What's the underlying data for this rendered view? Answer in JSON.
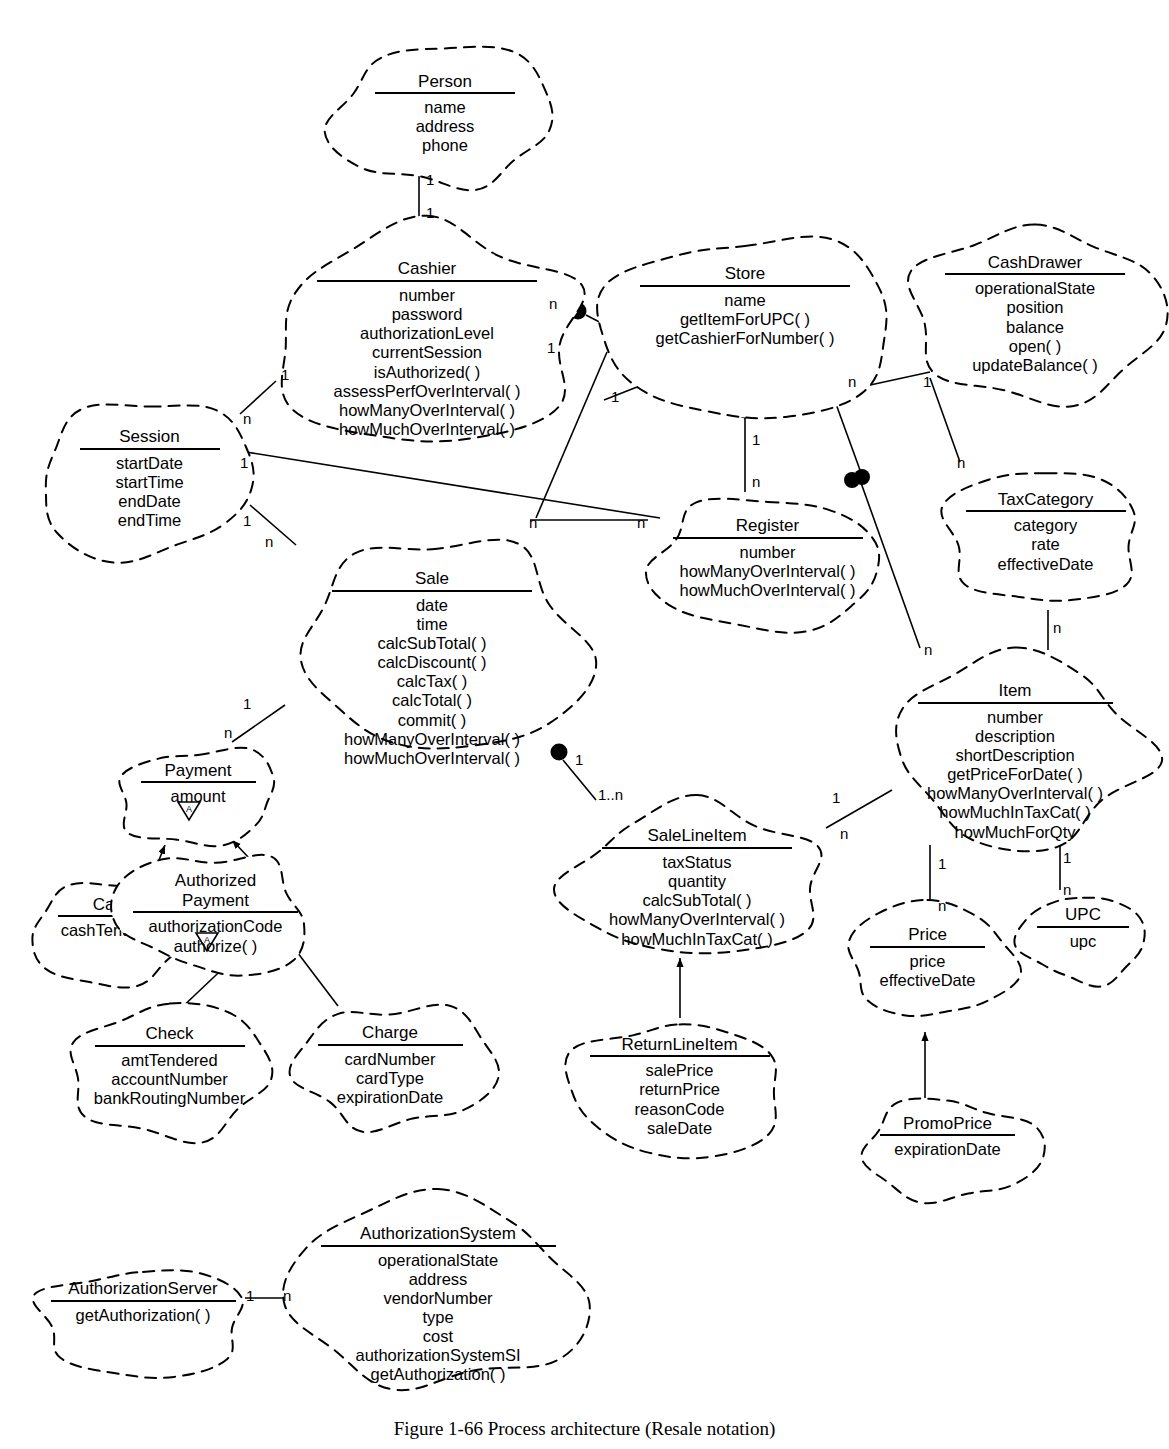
{
  "figure": {
    "caption": "Figure 1-66 Process architecture (Resale notation)"
  },
  "classes": [
    {
      "id": "person",
      "name": "Person",
      "members": [
        "name",
        "address",
        "phone"
      ],
      "x": 330,
      "y": 46,
      "w": 230,
      "h": 150,
      "nameW": 140
    },
    {
      "id": "cashier",
      "name": "Cashier",
      "members": [
        "number",
        "password",
        "authorizationLevel",
        "currentSession",
        "isAuthorized( )",
        "assessPerfOverInterval( )",
        "howManyOverInterval( )",
        "howMuchOverInterval( )"
      ],
      "x": 262,
      "y": 222,
      "w": 330,
      "h": 220,
      "nameW": 220
    },
    {
      "id": "store",
      "name": "Store",
      "members": [
        "name",
        "getItemForUPC( )",
        "getCashierForNumber( )"
      ],
      "x": 600,
      "y": 232,
      "w": 290,
      "h": 190,
      "nameW": 210
    },
    {
      "id": "cashdrawer",
      "name": "CashDrawer",
      "members": [
        "operationalState",
        "position",
        "balance",
        "open( )",
        "updateBalance( )"
      ],
      "x": 910,
      "y": 222,
      "w": 250,
      "h": 180,
      "nameW": 180
    },
    {
      "id": "session",
      "name": "Session",
      "members": [
        "startDate",
        "startTime",
        "endDate",
        "endTime"
      ],
      "x": 32,
      "y": 400,
      "w": 235,
      "h": 160,
      "nameW": 140
    },
    {
      "id": "sale",
      "name": "Sale",
      "members": [
        "date",
        "time",
        "calcSubTotal( )",
        "calcDiscount( )",
        "calcTax( )",
        "calcTotal( )",
        "commit( )",
        "howManyOverInterval( )",
        "howMuchOverInterval( )"
      ],
      "x": 282,
      "y": 530,
      "w": 300,
      "h": 230,
      "nameW": 200
    },
    {
      "id": "register",
      "name": "Register",
      "members": [
        "number",
        "howManyOverInterval( )",
        "howMuchOverInterval( )"
      ],
      "x": 640,
      "y": 492,
      "w": 255,
      "h": 140,
      "nameW": 190
    },
    {
      "id": "taxcategory",
      "name": "TaxCategory",
      "members": [
        "category",
        "rate",
        "effectiveDate"
      ],
      "x": 938,
      "y": 465,
      "w": 215,
      "h": 145,
      "nameW": 160
    },
    {
      "id": "item",
      "name": "Item",
      "members": [
        "number",
        "description",
        "shortDescription",
        "getPriceForDate( )",
        "howManyOverInterval( )",
        "howMuchInTaxCat( )",
        "howMuchForQty"
      ],
      "x": 880,
      "y": 648,
      "w": 270,
      "h": 195,
      "nameW": 195
    },
    {
      "id": "payment",
      "name": "Payment",
      "members": [
        "amount"
      ],
      "x": 108,
      "y": 742,
      "w": 180,
      "h": 110,
      "nameW": 115,
      "abstract": true
    },
    {
      "id": "cash",
      "name": "Cash",
      "members": [
        "cashTendered"
      ],
      "x": 30,
      "y": 876,
      "w": 165,
      "h": 110,
      "nameW": 110
    },
    {
      "id": "authorizedpayment",
      "name": "Authorized\nPayment",
      "name_lines": [
        "Authorized",
        "Payment"
      ],
      "members": [
        "authorizationCode",
        "authorize( )"
      ],
      "x": 118,
      "y": 848,
      "w": 195,
      "h": 135,
      "nameW": 165,
      "abstract": true
    },
    {
      "id": "salelineitem",
      "name": "SaleLineItem",
      "members": [
        "taxStatus",
        "quantity",
        "calcSubTotal( )",
        "howManyOverInterval( )",
        "howMuchInTaxCat( )"
      ],
      "x": 562,
      "y": 800,
      "w": 270,
      "h": 155,
      "nameW": 190
    },
    {
      "id": "price",
      "name": "Price",
      "members": [
        "price",
        "effectiveDate"
      ],
      "x": 840,
      "y": 905,
      "w": 175,
      "h": 120,
      "nameW": 115
    },
    {
      "id": "upc",
      "name": "UPC",
      "members": [
        "upc"
      ],
      "x": 1018,
      "y": 888,
      "w": 130,
      "h": 100,
      "nameW": 92
    },
    {
      "id": "check",
      "name": "Check",
      "members": [
        "amtTendered",
        "accountNumber",
        "bankRoutingNumber"
      ],
      "x": 62,
      "y": 1000,
      "w": 215,
      "h": 140,
      "nameW": 150
    },
    {
      "id": "charge",
      "name": "Charge",
      "members": [
        "cardNumber",
        "cardType",
        "expirationDate"
      ],
      "x": 290,
      "y": 1000,
      "w": 200,
      "h": 135,
      "nameW": 145
    },
    {
      "id": "returnlineitem",
      "name": "ReturnLineItem",
      "members": [
        "salePrice",
        "returnPrice",
        "reasonCode",
        "saleDate"
      ],
      "x": 572,
      "y": 1010,
      "w": 215,
      "h": 145,
      "nameW": 180
    },
    {
      "id": "promoprice",
      "name": "PromoPrice",
      "members": [
        "expirationDate"
      ],
      "x": 860,
      "y": 1095,
      "w": 175,
      "h": 110,
      "nameW": 135
    },
    {
      "id": "authorizationsystem",
      "name": "AuthorizationSystem",
      "members": [
        "operationalState",
        "address",
        "vendorNumber",
        "type",
        "cost",
        "authorizationSystemSI",
        "getAuthorization( )"
      ],
      "x": 288,
      "y": 1190,
      "w": 300,
      "h": 200,
      "nameW": 235
    },
    {
      "id": "authorizationserver",
      "name": "AuthorizationServer",
      "members": [
        "getAuthorization( )"
      ],
      "x": 28,
      "y": 1258,
      "w": 230,
      "h": 125,
      "nameW": 185
    }
  ],
  "multiplicities": [
    {
      "id": "m-person-cashier-top",
      "label": "1",
      "x": 426,
      "y": 172
    },
    {
      "id": "m-person-cashier-bottom",
      "label": "1",
      "x": 426,
      "y": 205
    },
    {
      "id": "m-cashier-store-n",
      "label": "n",
      "x": 549,
      "y": 296
    },
    {
      "id": "m-cashier-store-1",
      "label": "1",
      "x": 547,
      "y": 340
    },
    {
      "id": "m-cashier-session-1",
      "label": "1",
      "x": 281,
      "y": 367
    },
    {
      "id": "m-session-cashier-n",
      "label": "n",
      "x": 243,
      "y": 411
    },
    {
      "id": "m-store-register-1",
      "label": "1",
      "x": 611,
      "y": 389
    },
    {
      "id": "m-register-store-1",
      "label": "1",
      "x": 752,
      "y": 432
    },
    {
      "id": "m-register-store-n",
      "label": "n",
      "x": 752,
      "y": 474
    },
    {
      "id": "m-store-cashdrawer-n",
      "label": "n",
      "x": 848,
      "y": 374
    },
    {
      "id": "m-cashdrawer-reg-1",
      "label": "1",
      "x": 923,
      "y": 374
    },
    {
      "id": "m-store-item-n",
      "label": "n",
      "x": 957,
      "y": 455
    },
    {
      "id": "m-session-sale-1",
      "label": "1",
      "x": 243,
      "y": 513
    },
    {
      "id": "m-sale-session-n",
      "label": "n",
      "x": 265,
      "y": 534
    },
    {
      "id": "m-session-register-1",
      "label": "1",
      "x": 240,
      "y": 455
    },
    {
      "id": "m-register-session-n",
      "label": "n",
      "x": 529,
      "y": 515
    },
    {
      "id": "m-register-session-n2",
      "label": "n",
      "x": 637,
      "y": 515
    },
    {
      "id": "m-taxcat-item-n",
      "label": "n",
      "x": 1053,
      "y": 620
    },
    {
      "id": "m-store-item-n2",
      "label": "n",
      "x": 924,
      "y": 642
    },
    {
      "id": "m-sale-payment-1",
      "label": "1",
      "x": 243,
      "y": 696
    },
    {
      "id": "m-payment-sale-n",
      "label": "n",
      "x": 224,
      "y": 725
    },
    {
      "id": "m-sale-sli-1",
      "label": "1",
      "x": 575,
      "y": 752
    },
    {
      "id": "m-sli-sale-1n",
      "label": "1..n",
      "x": 598,
      "y": 787
    },
    {
      "id": "m-sli-item-1",
      "label": "1",
      "x": 832,
      "y": 790
    },
    {
      "id": "m-sli-item-n",
      "label": "n",
      "x": 840,
      "y": 826
    },
    {
      "id": "m-item-price-1",
      "label": "1",
      "x": 938,
      "y": 856
    },
    {
      "id": "m-price-item-n",
      "label": "n",
      "x": 938,
      "y": 898
    },
    {
      "id": "m-item-upc-1",
      "label": "1",
      "x": 1063,
      "y": 850
    },
    {
      "id": "m-upc-item-n",
      "label": "n",
      "x": 1063,
      "y": 882
    },
    {
      "id": "m-authserver-1",
      "label": "1",
      "x": 246,
      "y": 1288
    },
    {
      "id": "m-authsystem-n",
      "label": "n",
      "x": 283,
      "y": 1288
    }
  ]
}
